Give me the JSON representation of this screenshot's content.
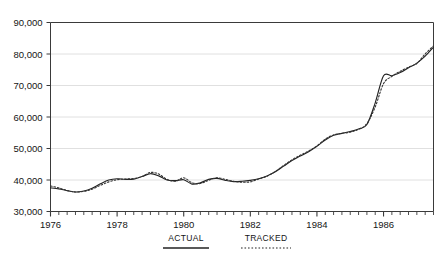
{
  "chart_data": {
    "type": "line",
    "title": "",
    "subtitle": "",
    "xlabel": "",
    "ylabel": "",
    "xlim": [
      1976.0,
      1987.5
    ],
    "ylim": [
      30000,
      90000
    ],
    "grid": true,
    "grid_axis": "y",
    "legend_position": "bottom-center",
    "y_ticks": [
      30000,
      40000,
      50000,
      60000,
      70000,
      80000,
      90000
    ],
    "y_tick_labels": [
      "30,000",
      "40,000",
      "50,000",
      "60,000",
      "70,000",
      "80,000",
      "90,000"
    ],
    "x_ticks": [
      1976,
      1978,
      1980,
      1982,
      1984,
      1986
    ],
    "x_tick_labels": [
      "1976",
      "1978",
      "1980",
      "1982",
      "1984",
      "1986"
    ],
    "x_minor_tick_step": 0.25,
    "x": [
      1976.0,
      1976.25,
      1976.5,
      1976.75,
      1977.0,
      1977.25,
      1977.5,
      1977.75,
      1978.0,
      1978.25,
      1978.5,
      1978.75,
      1979.0,
      1979.25,
      1979.5,
      1979.75,
      1980.0,
      1980.25,
      1980.5,
      1980.75,
      1981.0,
      1981.25,
      1981.5,
      1981.75,
      1982.0,
      1982.25,
      1982.5,
      1982.75,
      1983.0,
      1983.25,
      1983.5,
      1983.75,
      1984.0,
      1984.25,
      1984.5,
      1984.75,
      1985.0,
      1985.25,
      1985.5,
      1985.75,
      1986.0,
      1986.25,
      1986.5,
      1986.75,
      1987.0,
      1987.25,
      1987.5
    ],
    "series": [
      {
        "name": "ACTUAL",
        "style": "solid",
        "color": "#222222",
        "values": [
          37500,
          37200,
          36600,
          36200,
          36500,
          37400,
          38800,
          40000,
          40400,
          40200,
          40300,
          41100,
          42000,
          41300,
          40000,
          39800,
          40100,
          38700,
          39100,
          40200,
          40500,
          39900,
          39500,
          39600,
          39900,
          40400,
          41300,
          42600,
          44400,
          46200,
          47600,
          49000,
          50700,
          52700,
          54200,
          54800,
          55400,
          56200,
          57600,
          64500,
          73100,
          73100,
          74100,
          75600,
          77100,
          79300,
          82200
        ]
      },
      {
        "name": "TRACKED",
        "style": "dotted",
        "color": "#333333",
        "values": [
          38100,
          37500,
          36700,
          36200,
          36400,
          37100,
          38300,
          39400,
          40100,
          40300,
          40500,
          41100,
          42400,
          41900,
          40200,
          39600,
          40700,
          39100,
          38900,
          39900,
          40700,
          40200,
          39600,
          39300,
          39400,
          40300,
          41200,
          42700,
          44600,
          46400,
          47900,
          49200,
          50800,
          53000,
          54300,
          54800,
          55200,
          56100,
          57900,
          63200,
          70600,
          72900,
          74500,
          75800,
          77000,
          80000,
          82600
        ]
      }
    ],
    "legend": [
      {
        "label": "ACTUAL",
        "style": "solid"
      },
      {
        "label": "TRACKED",
        "style": "dotted"
      }
    ]
  },
  "style": {
    "axis_color": "#3a3a3a",
    "grid_color": "#d8d8d8",
    "text_color": "#151515",
    "background": "#ffffff"
  }
}
